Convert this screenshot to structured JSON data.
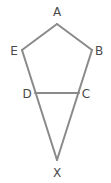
{
  "diagram": {
    "colors": {
      "stroke": "#8a8a8a",
      "label": "#4a4a4a"
    },
    "vertices": [
      {
        "id": "A",
        "label": "A",
        "x": 57,
        "y": 24,
        "lx": 57,
        "ly": 16
      },
      {
        "id": "B",
        "label": "B",
        "x": 92,
        "y": 50,
        "lx": 99,
        "ly": 55
      },
      {
        "id": "C",
        "label": "C",
        "x": 79,
        "y": 93,
        "lx": 86,
        "ly": 98
      },
      {
        "id": "D",
        "label": "D",
        "x": 35,
        "y": 93,
        "lx": 27,
        "ly": 98
      },
      {
        "id": "E",
        "label": "E",
        "x": 22,
        "y": 50,
        "lx": 14,
        "ly": 55
      },
      {
        "id": "X",
        "label": "X",
        "x": 57,
        "y": 160,
        "lx": 57,
        "ly": 177
      }
    ],
    "edges": [
      [
        "A",
        "B"
      ],
      [
        "A",
        "E"
      ],
      [
        "E",
        "X"
      ],
      [
        "B",
        "X"
      ],
      [
        "D",
        "C"
      ]
    ]
  }
}
